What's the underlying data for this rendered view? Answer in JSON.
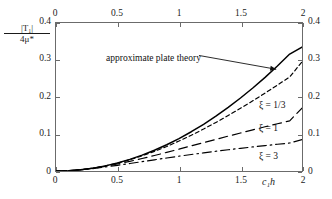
{
  "chart_data": {
    "type": "line",
    "title": "",
    "subtitle": "",
    "xlabel": "c₁h",
    "ylabel": "|T₁| / 4μ*",
    "ylabel_numerator": "|T₁|",
    "ylabel_denominator": "4μ*",
    "xlim": [
      0,
      2
    ],
    "ylim": [
      0,
      0.4
    ],
    "grid": false,
    "legend_position": "inline-right",
    "x_ticks": [
      0,
      0.5,
      1,
      1.5,
      2
    ],
    "x_tick_labels": [
      "0",
      "0.5",
      "1",
      "1.5",
      "2"
    ],
    "y_ticks": [
      0,
      0.1,
      0.2,
      0.3,
      0.4
    ],
    "y_tick_labels": [
      "0",
      "0.1",
      "0.2",
      "0.3",
      "0.4"
    ],
    "x_ticks_mirrored_top": true,
    "y_ticks_mirrored_right": true,
    "annotations": [
      {
        "text": "approximate plate theory",
        "x_data": 0.42,
        "y_data": 0.315,
        "arrow_to_x_data": 1.79,
        "arrow_to_y_data": 0.275
      }
    ],
    "series": [
      {
        "name": "approximate plate theory",
        "style": "solid",
        "color": "#000000",
        "x": [
          0,
          0.1,
          0.2,
          0.3,
          0.4,
          0.5,
          0.6,
          0.7,
          0.8,
          0.9,
          1.0,
          1.1,
          1.2,
          1.3,
          1.4,
          1.5,
          1.6,
          1.7,
          1.8,
          1.9,
          2.0
        ],
        "values": [
          0,
          0.0009,
          0.0035,
          0.0078,
          0.0139,
          0.0218,
          0.0315,
          0.0429,
          0.0561,
          0.071,
          0.0877,
          0.1061,
          0.1263,
          0.1482,
          0.1718,
          0.1972,
          0.2243,
          0.2531,
          0.2837,
          0.316,
          0.335
        ]
      },
      {
        "name": "ξ = 1/3",
        "label": "ξ = 1/3",
        "style": "dashed-short",
        "color": "#000000",
        "x": [
          0,
          0.1,
          0.2,
          0.3,
          0.4,
          0.5,
          0.6,
          0.7,
          0.8,
          0.9,
          1.0,
          1.1,
          1.2,
          1.3,
          1.4,
          1.5,
          1.6,
          1.7,
          1.8,
          1.9,
          2.0
        ],
        "values": [
          0,
          0.0009,
          0.0035,
          0.0078,
          0.0137,
          0.0213,
          0.0304,
          0.041,
          0.053,
          0.0663,
          0.0809,
          0.0966,
          0.1134,
          0.1312,
          0.1499,
          0.1694,
          0.1897,
          0.2106,
          0.2321,
          0.2541,
          0.295
        ]
      },
      {
        "name": "ξ = 1",
        "label": "ξ = 1",
        "style": "dashed-long",
        "color": "#000000",
        "x": [
          0,
          0.1,
          0.2,
          0.3,
          0.4,
          0.5,
          0.6,
          0.7,
          0.8,
          0.9,
          1.0,
          1.1,
          1.2,
          1.3,
          1.4,
          1.5,
          1.6,
          1.7,
          1.8,
          1.9,
          2.0
        ],
        "values": [
          0,
          0.0009,
          0.0034,
          0.0074,
          0.0126,
          0.0189,
          0.026,
          0.0337,
          0.0419,
          0.0504,
          0.0591,
          0.0679,
          0.0767,
          0.0855,
          0.0942,
          0.1028,
          0.1112,
          0.1195,
          0.1276,
          0.1356,
          0.17
        ]
      },
      {
        "name": "ξ = 3",
        "label": "ξ = 3",
        "style": "dash-dot",
        "color": "#000000",
        "x": [
          0,
          0.1,
          0.2,
          0.3,
          0.4,
          0.5,
          0.6,
          0.7,
          0.8,
          0.9,
          1.0,
          1.1,
          1.2,
          1.3,
          1.4,
          1.5,
          1.6,
          1.7,
          1.8,
          1.9,
          2.0
        ],
        "values": [
          0,
          0.0008,
          0.0031,
          0.0065,
          0.0107,
          0.0154,
          0.0203,
          0.0253,
          0.0303,
          0.0352,
          0.04,
          0.0446,
          0.049,
          0.0533,
          0.0574,
          0.0613,
          0.0651,
          0.0687,
          0.0722,
          0.0756,
          0.085
        ]
      }
    ]
  },
  "axes": {
    "x_label": "c₁h",
    "y_label_numerator": "|T₁|",
    "y_label_denominator": "4μ*"
  },
  "curve_labels": {
    "xi_one_third": "ξ = 1/3",
    "xi_one": "ξ = 1",
    "xi_three": "ξ = 3"
  },
  "annotation": {
    "plate_theory": "approximate plate theory"
  }
}
